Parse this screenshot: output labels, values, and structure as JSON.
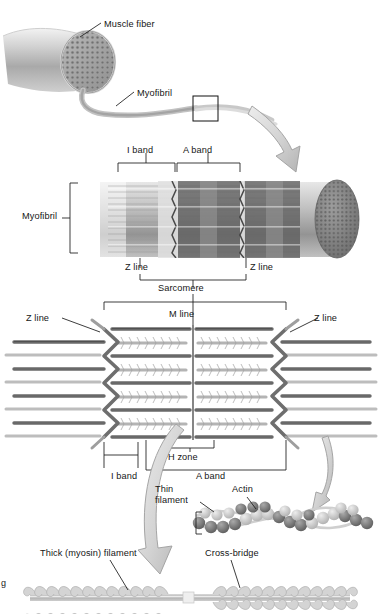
{
  "figure": {
    "domain_note": "anatomy-diagram"
  },
  "palette": {
    "ink": "#161616",
    "leader": "#1a1a1a",
    "fiber_light": "#e8e8e8",
    "fiber_mid": "#b8b8b8",
    "fiber_dark": "#8d8d8d",
    "myofibril_dark": "#6f6f6f",
    "band_dark": "#595959",
    "band_light": "#d8d8d8",
    "thin_filament": "#777777",
    "thick_filament": "#b5b5b5",
    "arrow_fill": "#d6d6d6",
    "arrow_stroke": "#9a9a9a",
    "actin_bead_dark": "#6b6b6b",
    "actin_bead_light": "#c9c9c9"
  },
  "panel_fiber": {
    "labels": [
      {
        "id": "muscle-fiber",
        "text": "Muscle fiber",
        "x": 104,
        "y": 19
      },
      {
        "id": "myofibril",
        "text": "Myofibril",
        "x": 137,
        "y": 88
      }
    ],
    "callout_box": {
      "x": 193,
      "y": 96,
      "w": 25,
      "h": 25
    }
  },
  "panel_myofibril": {
    "bracket_label": {
      "id": "myofibril-bracket",
      "text": "Myofibril",
      "x": 22,
      "y": 211
    },
    "labels": [
      {
        "id": "i-band-top",
        "text": "I band",
        "x": 127,
        "y": 148
      },
      {
        "id": "a-band-top",
        "text": "A band",
        "x": 183,
        "y": 148
      },
      {
        "id": "z-line-left",
        "text": "Z line",
        "x": 125,
        "y": 262
      },
      {
        "id": "z-line-right",
        "text": "Z line",
        "x": 250,
        "y": 262
      },
      {
        "id": "sarcomere",
        "text": "Sarcomere",
        "x": 158,
        "y": 283
      }
    ]
  },
  "panel_sarcomere": {
    "labels": [
      {
        "id": "z-line-left-2",
        "text": "Z line",
        "x": 26,
        "y": 315
      },
      {
        "id": "m-line",
        "text": "M line",
        "x": 169,
        "y": 312
      },
      {
        "id": "z-line-right-2",
        "text": "Z line",
        "x": 314,
        "y": 315
      },
      {
        "id": "h-zone",
        "text": "H zone",
        "x": 168,
        "y": 443
      },
      {
        "id": "i-band-bottom",
        "text": "I band",
        "x": 114,
        "y": 461
      },
      {
        "id": "a-band-bottom",
        "text": "A band",
        "x": 196,
        "y": 461
      }
    ]
  },
  "panel_filaments": {
    "labels": [
      {
        "id": "thin-filament",
        "text": "Thin filament",
        "x": 155,
        "y": 487
      },
      {
        "id": "actin",
        "text": "Actin",
        "x": 232,
        "y": 487
      },
      {
        "id": "thick-myosin-filament",
        "text": "Thick (myosin) filament",
        "x": 40,
        "y": 551
      },
      {
        "id": "cross-bridge",
        "text": "Cross-bridge",
        "x": 205,
        "y": 551
      }
    ]
  },
  "credit": {
    "text": "g",
    "x": 1,
    "y": 578
  }
}
